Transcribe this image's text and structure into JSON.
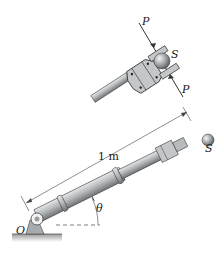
{
  "figure": {
    "type": "mechanics-diagram"
  },
  "labels": {
    "force_top": "P",
    "force_bottom": "P",
    "sphere_inset": "S",
    "sphere_main": "S",
    "length": "1 m",
    "angle": "θ",
    "pivot": "O"
  },
  "colors": {
    "arm_fill": "#b9bdbf",
    "arm_dark": "#7d8285",
    "ground": "#c8c8c8",
    "line": "#333333"
  }
}
